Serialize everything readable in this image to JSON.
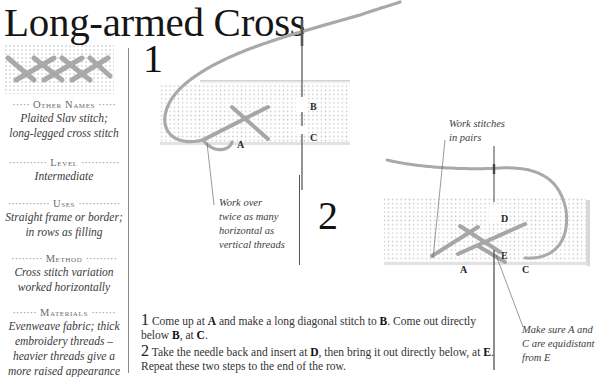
{
  "title": "Long-armed Cross",
  "sidebar": {
    "swatch_icon": "stitch-sample-swatch",
    "sections": [
      {
        "heading": "Other Names",
        "body": [
          "Plaited Slav stitch;",
          "long-legged cross stitch"
        ]
      },
      {
        "heading": "Level",
        "body": [
          "Intermediate"
        ]
      },
      {
        "heading": "Uses",
        "body": [
          "Straight frame or border;",
          "in rows as filling"
        ]
      },
      {
        "heading": "Method",
        "body": [
          "Cross stitch variation",
          "worked horizontally"
        ]
      },
      {
        "heading": "Materials",
        "body": [
          "Evenweave fabric; thick",
          "embroidery threads –",
          "heavier threads give a",
          "more raised appearance"
        ]
      }
    ]
  },
  "diagram1": {
    "step_number": "1",
    "labels": {
      "a": "A",
      "b": "B",
      "c": "C"
    },
    "note": [
      "Work over",
      "twice as many",
      "horizontal as",
      "vertical threads"
    ]
  },
  "diagram2": {
    "step_number": "2",
    "labels": {
      "a": "A",
      "c": "C",
      "d": "D",
      "e": "E"
    },
    "note_top": [
      "Work stitches",
      "in pairs"
    ],
    "note_bottom": [
      "Make sure A and",
      "C are equidistant",
      "from E"
    ]
  },
  "instructions": [
    {
      "number": "1",
      "parts": [
        "Come up at ",
        "A",
        " and make a long diagonal stitch to ",
        "B",
        ". Come out directly below ",
        "B",
        ", at ",
        "C",
        "."
      ]
    },
    {
      "number": "2",
      "parts": [
        "Take the needle back and insert at ",
        "D",
        ", then bring it out directly below, at ",
        "E",
        ". Repeat these two steps to the end of the row."
      ]
    }
  ],
  "colors": {
    "thread": "#a9a9a9",
    "fabric_dot": "#c8c8c8",
    "needle": "#7a7a7a",
    "divider": "#8a8a8a"
  }
}
